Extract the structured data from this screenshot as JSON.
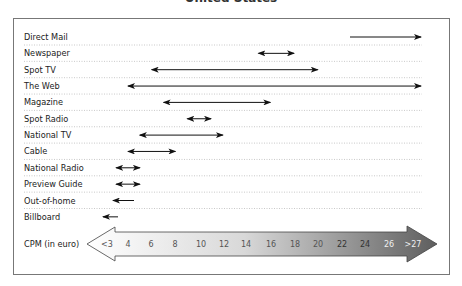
{
  "title": "United States",
  "axis": {
    "label": "CPM (in euro)",
    "ticks": [
      "<3",
      "4",
      "6",
      "8",
      "10",
      "12",
      "14",
      "16",
      "18",
      "20",
      "22",
      "24",
      "26",
      ">27"
    ]
  },
  "chart_data": {
    "type": "range",
    "title": "United States",
    "xlabel": "CPM (in euro)",
    "ylabel": "",
    "x_ticks": [
      "<3",
      "4",
      "6",
      "8",
      "10",
      "12",
      "14",
      "16",
      "18",
      "20",
      "22",
      "24",
      "26",
      ">27"
    ],
    "xlim": [
      2,
      28
    ],
    "grid": "dotted horizontal row separators",
    "series": [
      {
        "name": "Direct Mail",
        "min": 24,
        "max": 28,
        "arrows": "right"
      },
      {
        "name": "Newspaper",
        "min": 15,
        "max": 18,
        "arrows": "both"
      },
      {
        "name": "Spot TV",
        "min": 6,
        "max": 20,
        "arrows": "both"
      },
      {
        "name": "The Web",
        "min": 4,
        "max": 28,
        "arrows": "both"
      },
      {
        "name": "Magazine",
        "min": 7,
        "max": 16,
        "arrows": "both"
      },
      {
        "name": "Spot Radio",
        "min": 9,
        "max": 11,
        "arrows": "both"
      },
      {
        "name": "National TV",
        "min": 5,
        "max": 12,
        "arrows": "both"
      },
      {
        "name": "Cable",
        "min": 4,
        "max": 8,
        "arrows": "both"
      },
      {
        "name": "National Radio",
        "min": 3,
        "max": 5,
        "arrows": "both"
      },
      {
        "name": "Preview Guide",
        "min": 3,
        "max": 5,
        "arrows": "both"
      },
      {
        "name": "Out-of-home",
        "min": 3,
        "max": 4,
        "arrows": "left"
      },
      {
        "name": "Billboard",
        "min": 2.5,
        "max": 3,
        "arrows": "left"
      }
    ]
  },
  "colors": {
    "arrow": "#111111",
    "frame": "#777777",
    "dots": "#bbbbbb",
    "gradient_start": "#ffffff",
    "gradient_end": "#6a6a6a"
  }
}
